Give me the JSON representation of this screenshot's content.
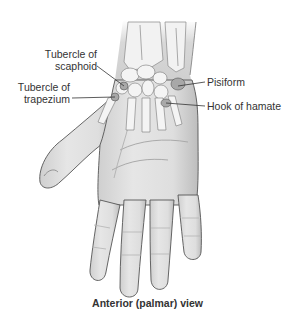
{
  "figure": {
    "view": "Anterior (palmar) view",
    "colors": {
      "skin_fill": "#e2e2e2",
      "skin_shadow": "#b8b8b8",
      "outline": "#555555",
      "bone_fill": "#f4f4f4",
      "bone_outline": "#777777",
      "highlight_bone": "#9a9a9a",
      "leader_line": "#333333",
      "text": "#333333"
    },
    "labels": [
      {
        "id": "tubercle-of-scaphoid",
        "line1": "Tubercle of",
        "line2": "scaphoid",
        "side": "left"
      },
      {
        "id": "tubercle-of-trapezium",
        "line1": "Tubercle of",
        "line2": "trapezium",
        "side": "left"
      },
      {
        "id": "pisiform",
        "line1": "Pisiform",
        "side": "right"
      },
      {
        "id": "hook-of-hamate",
        "line1": "Hook of hamate",
        "side": "right"
      }
    ]
  }
}
